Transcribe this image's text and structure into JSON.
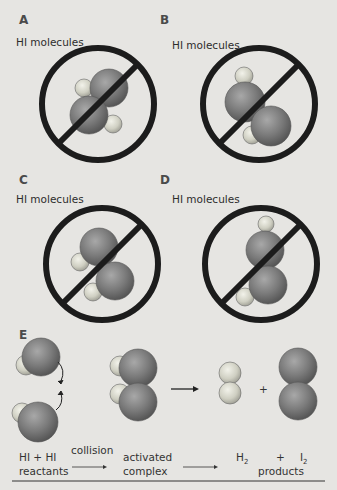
{
  "panels": [
    {
      "letter": "A",
      "label": "HI molecules",
      "status": "no-reaction"
    },
    {
      "letter": "B",
      "label": "HI molecules",
      "status": "no-reaction"
    },
    {
      "letter": "C",
      "label": "HI molecules",
      "status": "no-reaction"
    },
    {
      "letter": "D",
      "label": "HI molecules",
      "status": "no-reaction"
    },
    {
      "letter": "E",
      "status": "successful-collision"
    }
  ],
  "reaction": {
    "reactants_line1": "HI + HI",
    "reactants_line2": "reactants",
    "arrow1_label": "collision",
    "intermediate_line1": "activated",
    "intermediate_line2": "complex",
    "product1": "H",
    "product1_sub": "2",
    "plus": "+",
    "product2": "I",
    "product2_sub": "2",
    "products_label": "products",
    "plus_between_products": "+"
  },
  "colors": {
    "background": "#e6e5e2",
    "prohibit_sign": "#1c1c1c",
    "iodine_atom": "#7a7a7a",
    "hydrogen_atom": "#d8d8cc"
  }
}
